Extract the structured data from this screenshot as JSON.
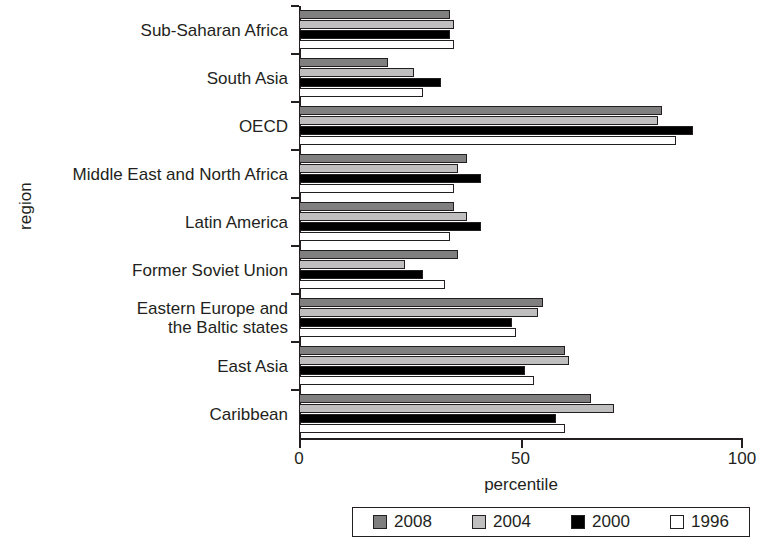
{
  "chart_data": {
    "type": "bar",
    "orientation": "horizontal",
    "title": "",
    "xlabel": "percentile",
    "ylabel": "region",
    "xlim": [
      0,
      100
    ],
    "xticks": [
      0,
      50,
      100
    ],
    "xtick_labels": [
      "0",
      "50",
      "100"
    ],
    "grid": false,
    "legend_position": "bottom",
    "categories": [
      "Sub-Saharan Africa",
      "South Asia",
      "OECD",
      "Middle East and North Africa",
      "Latin America",
      "Former Soviet Union",
      "Eastern Europe and\nthe Baltic states",
      "East Asia",
      "Caribbean"
    ],
    "series": [
      {
        "name": "2008",
        "color": "#7f7f7f",
        "values": [
          34,
          20,
          82,
          38,
          35,
          36,
          55,
          60,
          66
        ]
      },
      {
        "name": "2004",
        "color": "#bfbfbf",
        "values": [
          35,
          26,
          81,
          36,
          38,
          24,
          54,
          61,
          71
        ]
      },
      {
        "name": "2000",
        "color": "#000000",
        "values": [
          34,
          32,
          89,
          41,
          41,
          28,
          48,
          51,
          58
        ]
      },
      {
        "name": "1996",
        "color": "#ffffff",
        "values": [
          35,
          28,
          85,
          35,
          34,
          33,
          49,
          53,
          60
        ]
      }
    ]
  },
  "legend": {
    "entries": [
      {
        "label": "2008",
        "color": "#7f7f7f"
      },
      {
        "label": "2004",
        "color": "#bfbfbf"
      },
      {
        "label": "2000",
        "color": "#000000"
      },
      {
        "label": "1996",
        "color": "#ffffff"
      }
    ]
  }
}
